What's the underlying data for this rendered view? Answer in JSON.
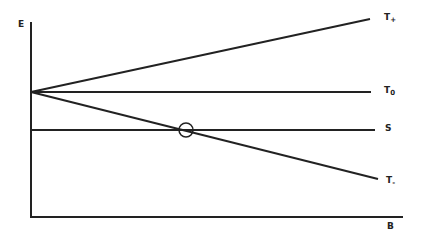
{
  "diagram": {
    "axes": {
      "y_label": "E",
      "x_label": "B"
    },
    "lines": [
      {
        "name": "T+",
        "label_main": "T",
        "label_sub": "+"
      },
      {
        "name": "T0",
        "label_main": "T",
        "label_sub": "0"
      },
      {
        "name": "S",
        "label_main": "S",
        "label_sub": ""
      },
      {
        "name": "T-",
        "label_main": "T",
        "label_sub": "-"
      }
    ],
    "marker": "circle at intersection of S and T-",
    "line_color": "#222222"
  }
}
